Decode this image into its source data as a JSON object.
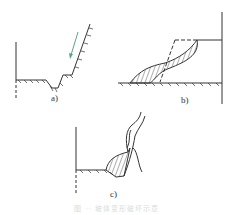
{
  "figure": {
    "panels": [
      {
        "id": "a",
        "label": "a)",
        "description": "cut slope with ditch, arrow indicating downslope movement"
      },
      {
        "id": "b",
        "label": "b)",
        "description": "slope with original outline dashed and hatched slipped mass at toe"
      },
      {
        "id": "c",
        "label": "c)",
        "description": "steep face with hatched collapsed mass at base"
      }
    ],
    "caption": "图 ·· 坡体变形破坏示意",
    "colors": {
      "line": "#333333",
      "arrow": "#5aa58a",
      "caption": "#d8dcd8"
    }
  }
}
